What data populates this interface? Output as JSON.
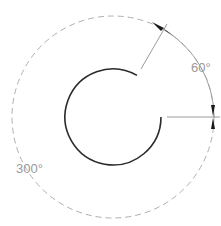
{
  "diagram": {
    "type": "arc-angle-dimension",
    "labels": {
      "small_angle": "60°",
      "large_angle": "300°"
    },
    "colors": {
      "arc": "#2a2a2a",
      "dashed_circle": "#b0b0b0",
      "leader": "#808080",
      "label": "#9a9a9a",
      "arrow": "#1a1a1a"
    }
  }
}
